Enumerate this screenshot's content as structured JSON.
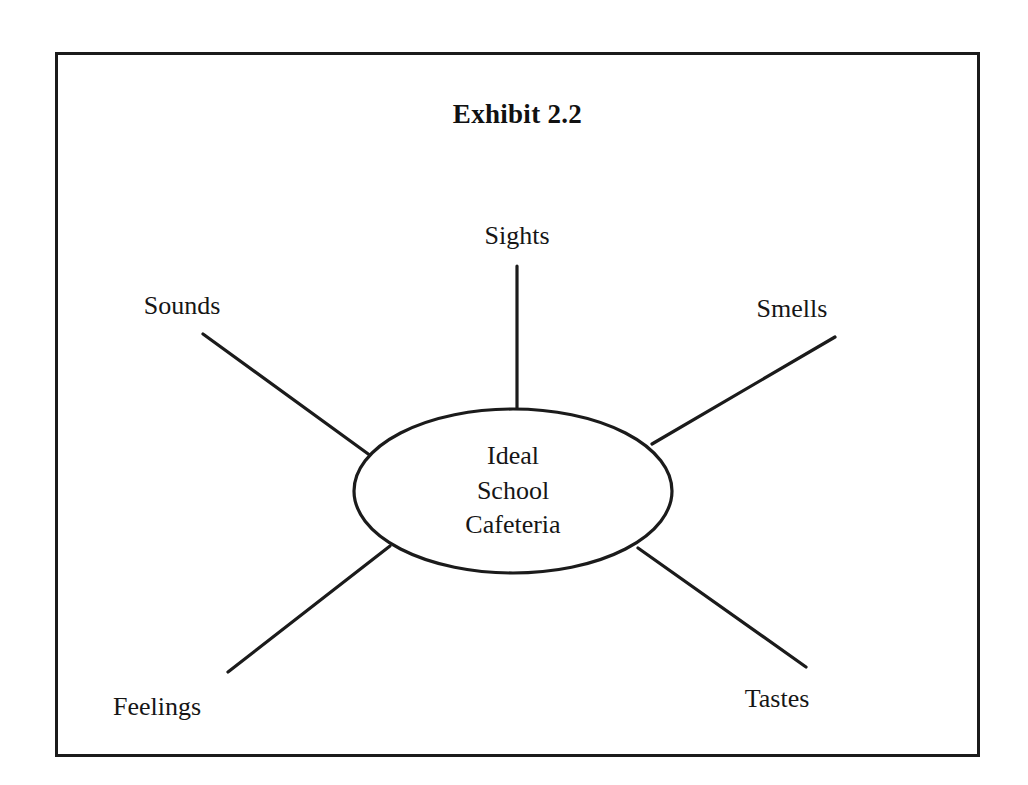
{
  "document": {
    "title": "Exhibit 2.2",
    "type": "sensory web diagram"
  },
  "diagram": {
    "center": {
      "lines": [
        "Ideal",
        "School",
        "Cafeteria"
      ]
    },
    "nodes": [
      {
        "id": "sights",
        "label": "Sights"
      },
      {
        "id": "sounds",
        "label": "Sounds"
      },
      {
        "id": "smells",
        "label": "Smells"
      },
      {
        "id": "feelings",
        "label": "Feelings"
      },
      {
        "id": "tastes",
        "label": "Tastes"
      }
    ]
  },
  "colors": {
    "ink": "#1b1b1b",
    "text": "#161616",
    "background": "#ffffff"
  }
}
